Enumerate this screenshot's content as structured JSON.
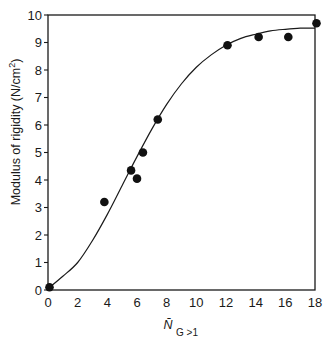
{
  "chart_data": {
    "type": "scatter",
    "title": "",
    "xlabel": "N̄",
    "xlabel_subscript": "G >1",
    "ylabel": "Modulus of rigidity (N/cm²)",
    "ylabel_parts": {
      "main": "Modulus of rigidity (N/cm",
      "sup": "2",
      "close": ")"
    },
    "xlim": [
      0,
      18
    ],
    "ylim": [
      0,
      10
    ],
    "xticks": [
      0,
      2,
      4,
      6,
      8,
      10,
      12,
      14,
      16,
      18
    ],
    "xtick_labels": [
      "0",
      "2",
      "4",
      "6",
      "8",
      "10",
      "12",
      "14",
      "16",
      "18"
    ],
    "yticks": [
      0,
      1,
      2,
      3,
      4,
      5,
      6,
      7,
      8,
      9,
      10
    ],
    "ytick_labels": [
      "0",
      "1",
      "2",
      "3",
      "4",
      "5",
      "6",
      "7",
      "8",
      "9",
      "10"
    ],
    "grid": false,
    "legend": null,
    "series": [
      {
        "name": "measured",
        "kind": "points",
        "marker": "filled-circle",
        "x": [
          0.1,
          3.8,
          5.6,
          6.0,
          6.4,
          7.4,
          12.1,
          14.2,
          16.2,
          18.1
        ],
        "y": [
          0.1,
          3.2,
          4.35,
          4.05,
          5.0,
          6.2,
          8.9,
          9.2,
          9.2,
          9.7
        ]
      },
      {
        "name": "fitted curve",
        "kind": "line",
        "x": [
          0,
          1,
          2,
          3,
          4,
          5,
          6,
          7,
          8,
          9,
          10,
          11,
          12,
          13,
          14,
          15,
          16,
          17,
          18
        ],
        "y": [
          0.05,
          0.5,
          1.0,
          1.8,
          2.75,
          3.8,
          4.85,
          5.85,
          6.75,
          7.5,
          8.1,
          8.55,
          8.9,
          9.15,
          9.3,
          9.42,
          9.48,
          9.52,
          9.52
        ]
      }
    ]
  }
}
